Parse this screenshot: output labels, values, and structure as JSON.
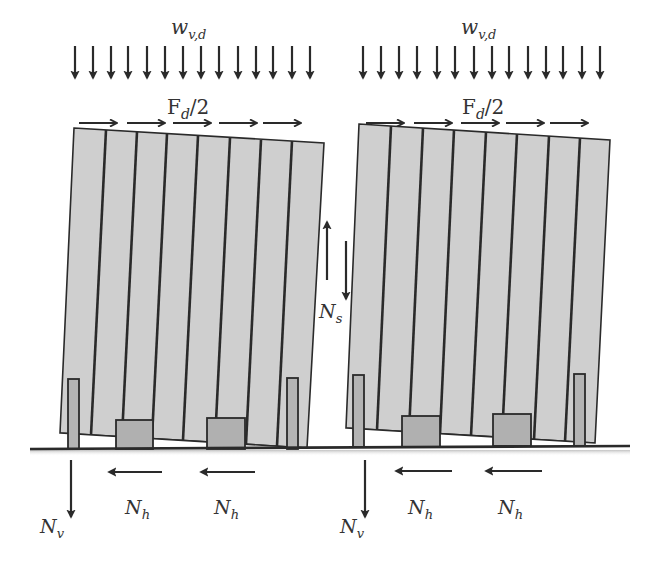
{
  "figure": {
    "colors": {
      "background": "#ffffff",
      "panel_fill": "#cfcfcf",
      "post_fill": "#b4b4b4",
      "block_fill": "#b0b0b0",
      "line": "#2a2a2a",
      "text": "#333333"
    }
  },
  "walls": [
    {
      "id": "left",
      "distributed_load_label": {
        "base": "w",
        "sub": "v,d"
      },
      "horizontal_force_label": {
        "base": "F",
        "sub": "d",
        "suffix": "/2"
      },
      "vertical_arrow_count": 14,
      "horizontal_arrow_count": 5,
      "reactions": {
        "vertical": {
          "base": "N",
          "sub": "v"
        },
        "horizontal": [
          {
            "base": "N",
            "sub": "h"
          },
          {
            "base": "N",
            "sub": "h"
          }
        ]
      }
    },
    {
      "id": "right",
      "distributed_load_label": {
        "base": "w",
        "sub": "v,d"
      },
      "horizontal_force_label": {
        "base": "F",
        "sub": "d",
        "suffix": "/2"
      },
      "vertical_arrow_count": 14,
      "horizontal_arrow_count": 5,
      "reactions": {
        "vertical": {
          "base": "N",
          "sub": "v"
        },
        "horizontal": [
          {
            "base": "N",
            "sub": "h"
          },
          {
            "base": "N",
            "sub": "h"
          }
        ]
      }
    }
  ],
  "joint": {
    "shear_label": {
      "base": "N",
      "sub": "s"
    }
  }
}
